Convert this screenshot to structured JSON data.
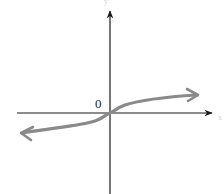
{
  "diagram": {
    "type": "function-graph",
    "origin_label": "0",
    "x_axis_label": "x",
    "y_axis_label": "y",
    "colors": {
      "axis": "#1a1a1a",
      "curve": "#8a8a8a",
      "background": "#ffffff",
      "label": "#222222"
    },
    "axes": {
      "origin": [
        110,
        113
      ],
      "x_start": 17,
      "x_end": 213,
      "y_top": 10,
      "y_bottom": 194
    },
    "curve": {
      "left_end": [
        20,
        133
      ],
      "right_end": [
        199,
        95
      ],
      "shape": "cube-root",
      "arrows": "both-ends"
    }
  }
}
